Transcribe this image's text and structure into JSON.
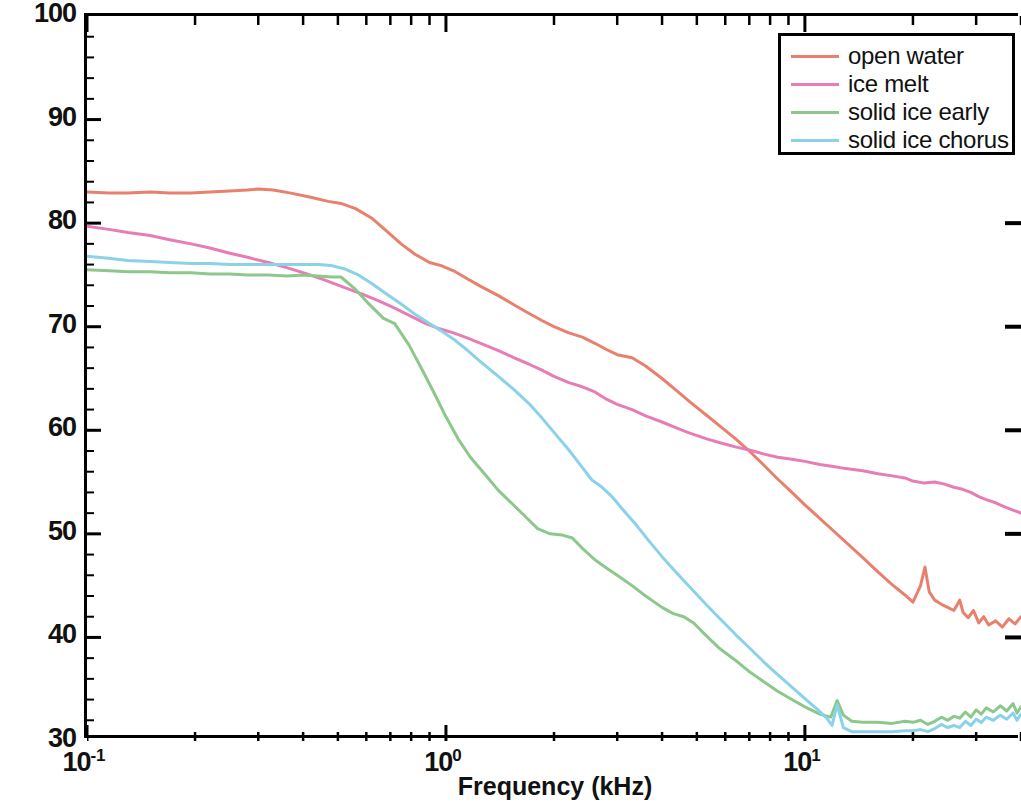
{
  "chart_data": {
    "type": "line",
    "title": "",
    "xlabel": "Frequency (kHz)",
    "ylabel": "Sound Intensity (dB rel 1 μPa²Hz⁻¹)",
    "xscale": "log",
    "yscale": "linear",
    "xlim": [
      0.1,
      40
    ],
    "ylim": [
      30,
      100
    ],
    "grid": false,
    "legend_position": "top-right",
    "x_tick_labels": [
      "10⁻¹",
      "10⁰",
      "10¹"
    ],
    "x_tick_values": [
      0.1,
      1,
      10
    ],
    "y_tick_labels": [
      "30",
      "40",
      "50",
      "60",
      "70",
      "80",
      "90",
      "100"
    ],
    "y_tick_values": [
      30,
      40,
      50,
      60,
      70,
      80,
      90,
      100
    ],
    "colors": {
      "open_water": "#e8806d",
      "ice_melt": "#e87cb4",
      "solid_ice_early": "#8cc88c",
      "solid_ice_chorus": "#8ad2ea",
      "axis": "#000000",
      "text": "#111111",
      "background": "#ffffff"
    },
    "series": [
      {
        "name": "open water",
        "color": "#e8806d",
        "points": [
          [
            0.1,
            83.0
          ],
          [
            0.115,
            82.9
          ],
          [
            0.13,
            82.9
          ],
          [
            0.15,
            83.0
          ],
          [
            0.17,
            82.9
          ],
          [
            0.195,
            82.9
          ],
          [
            0.22,
            83.0
          ],
          [
            0.25,
            83.1
          ],
          [
            0.28,
            83.2
          ],
          [
            0.3,
            83.3
          ],
          [
            0.33,
            83.2
          ],
          [
            0.37,
            82.9
          ],
          [
            0.42,
            82.5
          ],
          [
            0.47,
            82.1
          ],
          [
            0.51,
            81.9
          ],
          [
            0.56,
            81.4
          ],
          [
            0.62,
            80.5
          ],
          [
            0.68,
            79.3
          ],
          [
            0.75,
            78.0
          ],
          [
            0.82,
            77.0
          ],
          [
            0.9,
            76.2
          ],
          [
            0.97,
            75.9
          ],
          [
            1.05,
            75.4
          ],
          [
            1.15,
            74.6
          ],
          [
            1.25,
            73.9
          ],
          [
            1.4,
            73.0
          ],
          [
            1.55,
            72.1
          ],
          [
            1.7,
            71.3
          ],
          [
            1.85,
            70.6
          ],
          [
            2.0,
            70.0
          ],
          [
            2.2,
            69.4
          ],
          [
            2.4,
            69.0
          ],
          [
            2.6,
            68.4
          ],
          [
            2.8,
            67.8
          ],
          [
            3.0,
            67.3
          ],
          [
            3.3,
            67.0
          ],
          [
            3.6,
            66.2
          ],
          [
            4.0,
            65.0
          ],
          [
            4.4,
            63.8
          ],
          [
            4.8,
            62.7
          ],
          [
            5.3,
            61.5
          ],
          [
            5.8,
            60.4
          ],
          [
            6.4,
            59.2
          ],
          [
            7.0,
            58.0
          ],
          [
            7.7,
            56.6
          ],
          [
            8.4,
            55.3
          ],
          [
            9.2,
            54.0
          ],
          [
            10.0,
            52.8
          ],
          [
            11.0,
            51.5
          ],
          [
            12.0,
            50.3
          ],
          [
            13.0,
            49.2
          ],
          [
            14.5,
            47.7
          ],
          [
            16.0,
            46.3
          ],
          [
            17.5,
            45.1
          ],
          [
            19.0,
            44.1
          ],
          [
            20.0,
            43.4
          ],
          [
            21.0,
            45.0
          ],
          [
            21.6,
            46.8
          ],
          [
            22.2,
            44.4
          ],
          [
            23.0,
            43.6
          ],
          [
            24.0,
            43.2
          ],
          [
            25.0,
            42.9
          ],
          [
            26.0,
            42.6
          ],
          [
            27.0,
            43.6
          ],
          [
            27.6,
            42.4
          ],
          [
            28.5,
            41.9
          ],
          [
            29.5,
            42.6
          ],
          [
            30.5,
            41.4
          ],
          [
            31.5,
            42.0
          ],
          [
            32.5,
            41.2
          ],
          [
            34.0,
            41.6
          ],
          [
            35.5,
            41.0
          ],
          [
            37.0,
            41.8
          ],
          [
            38.5,
            41.3
          ],
          [
            40.0,
            42.0
          ]
        ]
      },
      {
        "name": "ice melt",
        "color": "#e87cb4",
        "points": [
          [
            0.1,
            79.7
          ],
          [
            0.115,
            79.4
          ],
          [
            0.13,
            79.1
          ],
          [
            0.15,
            78.8
          ],
          [
            0.17,
            78.4
          ],
          [
            0.195,
            78.0
          ],
          [
            0.22,
            77.6
          ],
          [
            0.25,
            77.1
          ],
          [
            0.28,
            76.7
          ],
          [
            0.32,
            76.2
          ],
          [
            0.36,
            75.7
          ],
          [
            0.41,
            75.1
          ],
          [
            0.46,
            74.5
          ],
          [
            0.52,
            73.8
          ],
          [
            0.58,
            73.2
          ],
          [
            0.65,
            72.5
          ],
          [
            0.72,
            71.8
          ],
          [
            0.8,
            71.0
          ],
          [
            0.88,
            70.3
          ],
          [
            0.96,
            69.8
          ],
          [
            1.05,
            69.4
          ],
          [
            1.15,
            68.9
          ],
          [
            1.25,
            68.4
          ],
          [
            1.4,
            67.7
          ],
          [
            1.55,
            67.0
          ],
          [
            1.7,
            66.4
          ],
          [
            1.85,
            65.8
          ],
          [
            2.0,
            65.2
          ],
          [
            2.2,
            64.6
          ],
          [
            2.4,
            64.2
          ],
          [
            2.6,
            63.7
          ],
          [
            2.8,
            63.0
          ],
          [
            3.0,
            62.5
          ],
          [
            3.3,
            62.0
          ],
          [
            3.6,
            61.4
          ],
          [
            4.0,
            60.8
          ],
          [
            4.4,
            60.2
          ],
          [
            4.8,
            59.7
          ],
          [
            5.3,
            59.2
          ],
          [
            5.8,
            58.8
          ],
          [
            6.4,
            58.4
          ],
          [
            7.0,
            58.1
          ],
          [
            7.7,
            57.7
          ],
          [
            8.4,
            57.4
          ],
          [
            9.2,
            57.2
          ],
          [
            10.0,
            57.0
          ],
          [
            11.0,
            56.7
          ],
          [
            12.0,
            56.5
          ],
          [
            13.0,
            56.3
          ],
          [
            14.5,
            56.1
          ],
          [
            16.0,
            55.8
          ],
          [
            17.5,
            55.6
          ],
          [
            19.0,
            55.4
          ],
          [
            20.0,
            55.1
          ],
          [
            21.5,
            54.9
          ],
          [
            23.0,
            55.0
          ],
          [
            24.5,
            54.8
          ],
          [
            26.0,
            54.5
          ],
          [
            27.5,
            54.3
          ],
          [
            29.0,
            54.0
          ],
          [
            30.5,
            53.6
          ],
          [
            32.0,
            53.3
          ],
          [
            34.0,
            53.0
          ],
          [
            36.0,
            52.6
          ],
          [
            38.0,
            52.3
          ],
          [
            40.0,
            52.0
          ]
        ]
      },
      {
        "name": "solid ice early",
        "color": "#8cc88c",
        "points": [
          [
            0.1,
            75.5
          ],
          [
            0.115,
            75.4
          ],
          [
            0.13,
            75.3
          ],
          [
            0.15,
            75.3
          ],
          [
            0.17,
            75.2
          ],
          [
            0.195,
            75.2
          ],
          [
            0.22,
            75.1
          ],
          [
            0.25,
            75.1
          ],
          [
            0.28,
            75.0
          ],
          [
            0.32,
            75.0
          ],
          [
            0.36,
            74.9
          ],
          [
            0.4,
            75.0
          ],
          [
            0.44,
            74.9
          ],
          [
            0.48,
            74.8
          ],
          [
            0.51,
            74.8
          ],
          [
            0.56,
            73.6
          ],
          [
            0.61,
            72.2
          ],
          [
            0.67,
            70.8
          ],
          [
            0.72,
            70.3
          ],
          [
            0.79,
            68.2
          ],
          [
            0.86,
            65.8
          ],
          [
            0.93,
            63.5
          ],
          [
            1.0,
            61.3
          ],
          [
            1.08,
            59.2
          ],
          [
            1.17,
            57.4
          ],
          [
            1.28,
            55.8
          ],
          [
            1.4,
            54.2
          ],
          [
            1.52,
            53.0
          ],
          [
            1.65,
            51.8
          ],
          [
            1.8,
            50.5
          ],
          [
            1.95,
            50.0
          ],
          [
            2.1,
            49.9
          ],
          [
            2.25,
            49.6
          ],
          [
            2.4,
            48.6
          ],
          [
            2.6,
            47.5
          ],
          [
            2.8,
            46.7
          ],
          [
            3.0,
            46.0
          ],
          [
            3.3,
            45.0
          ],
          [
            3.6,
            44.0
          ],
          [
            4.0,
            42.9
          ],
          [
            4.3,
            42.3
          ],
          [
            4.6,
            42.0
          ],
          [
            4.9,
            41.4
          ],
          [
            5.3,
            40.2
          ],
          [
            5.8,
            38.9
          ],
          [
            6.4,
            37.8
          ],
          [
            7.0,
            36.7
          ],
          [
            7.7,
            35.7
          ],
          [
            8.4,
            34.8
          ],
          [
            9.2,
            34.0
          ],
          [
            10.0,
            33.3
          ],
          [
            11.0,
            32.6
          ],
          [
            11.8,
            32.3
          ],
          [
            12.3,
            33.9
          ],
          [
            12.8,
            32.5
          ],
          [
            13.5,
            31.9
          ],
          [
            14.5,
            31.8
          ],
          [
            16.0,
            31.8
          ],
          [
            17.5,
            31.7
          ],
          [
            19.0,
            31.9
          ],
          [
            20.0,
            31.8
          ],
          [
            21.0,
            32.0
          ],
          [
            22.0,
            31.6
          ],
          [
            23.0,
            31.9
          ],
          [
            24.0,
            32.3
          ],
          [
            25.0,
            32.0
          ],
          [
            26.0,
            32.4
          ],
          [
            27.0,
            32.2
          ],
          [
            28.0,
            32.8
          ],
          [
            29.0,
            32.3
          ],
          [
            30.0,
            33.0
          ],
          [
            31.0,
            32.6
          ],
          [
            32.0,
            33.2
          ],
          [
            33.5,
            32.8
          ],
          [
            35.0,
            33.4
          ],
          [
            36.5,
            32.9
          ],
          [
            38.0,
            33.6
          ],
          [
            39.0,
            32.7
          ],
          [
            40.0,
            33.3
          ]
        ]
      },
      {
        "name": "solid ice chorus",
        "color": "#8ad2ea",
        "points": [
          [
            0.1,
            76.8
          ],
          [
            0.115,
            76.6
          ],
          [
            0.13,
            76.4
          ],
          [
            0.15,
            76.3
          ],
          [
            0.17,
            76.2
          ],
          [
            0.195,
            76.1
          ],
          [
            0.22,
            76.1
          ],
          [
            0.25,
            76.0
          ],
          [
            0.28,
            76.0
          ],
          [
            0.32,
            76.0
          ],
          [
            0.36,
            76.0
          ],
          [
            0.4,
            76.0
          ],
          [
            0.44,
            76.0
          ],
          [
            0.48,
            75.9
          ],
          [
            0.52,
            75.6
          ],
          [
            0.57,
            75.0
          ],
          [
            0.62,
            74.2
          ],
          [
            0.68,
            73.2
          ],
          [
            0.75,
            72.2
          ],
          [
            0.82,
            71.2
          ],
          [
            0.9,
            70.3
          ],
          [
            0.97,
            69.6
          ],
          [
            1.05,
            68.8
          ],
          [
            1.15,
            67.7
          ],
          [
            1.25,
            66.6
          ],
          [
            1.4,
            65.2
          ],
          [
            1.55,
            63.9
          ],
          [
            1.7,
            62.6
          ],
          [
            1.85,
            61.2
          ],
          [
            2.0,
            59.8
          ],
          [
            2.2,
            58.1
          ],
          [
            2.4,
            56.4
          ],
          [
            2.55,
            55.2
          ],
          [
            2.7,
            54.6
          ],
          [
            2.9,
            53.6
          ],
          [
            3.1,
            52.4
          ],
          [
            3.4,
            50.8
          ],
          [
            3.7,
            49.2
          ],
          [
            4.0,
            47.8
          ],
          [
            4.4,
            46.2
          ],
          [
            4.8,
            44.8
          ],
          [
            5.3,
            43.2
          ],
          [
            5.8,
            41.8
          ],
          [
            6.4,
            40.3
          ],
          [
            7.0,
            39.0
          ],
          [
            7.7,
            37.6
          ],
          [
            8.4,
            36.4
          ],
          [
            9.2,
            35.2
          ],
          [
            10.0,
            34.1
          ],
          [
            10.8,
            33.1
          ],
          [
            11.5,
            32.2
          ],
          [
            11.9,
            31.5
          ],
          [
            12.3,
            33.5
          ],
          [
            12.8,
            31.3
          ],
          [
            13.5,
            30.9
          ],
          [
            14.5,
            30.9
          ],
          [
            16.0,
            30.9
          ],
          [
            17.5,
            30.9
          ],
          [
            19.0,
            31.0
          ],
          [
            20.0,
            31.0
          ],
          [
            21.0,
            31.1
          ],
          [
            22.0,
            30.9
          ],
          [
            23.0,
            31.2
          ],
          [
            24.0,
            31.6
          ],
          [
            25.0,
            31.3
          ],
          [
            26.0,
            31.5
          ],
          [
            27.0,
            31.3
          ],
          [
            28.0,
            31.9
          ],
          [
            29.0,
            31.5
          ],
          [
            30.0,
            32.1
          ],
          [
            31.0,
            31.8
          ],
          [
            32.0,
            32.3
          ],
          [
            33.5,
            32.0
          ],
          [
            35.0,
            32.5
          ],
          [
            36.5,
            32.1
          ],
          [
            38.0,
            32.7
          ],
          [
            39.0,
            32.0
          ],
          [
            40.0,
            32.6
          ]
        ]
      }
    ]
  },
  "legend": {
    "entries": [
      {
        "label": "open water",
        "color": "#e8806d"
      },
      {
        "label": "ice melt",
        "color": "#e87cb4"
      },
      {
        "label": "solid ice early",
        "color": "#8cc88c"
      },
      {
        "label": "solid ice chorus",
        "color": "#8ad2ea"
      }
    ]
  },
  "axes": {
    "x_title": "Frequency (kHz)",
    "y_title_html": "Sound Intensity (dB rel 1 μPa²Hz⁻¹)"
  }
}
